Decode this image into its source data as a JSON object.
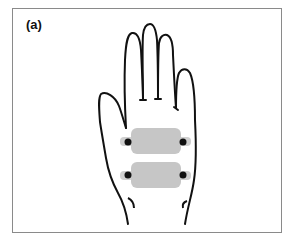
{
  "figure": {
    "panel_label": "(a)",
    "electrodes": [
      {
        "name": "upper-electrode-pad",
        "color": "#c4c4c4"
      },
      {
        "name": "lower-electrode-pad",
        "color": "#c4c4c4"
      }
    ],
    "colors": {
      "outline": "#111111",
      "pad": "#c6c6c6",
      "frame": "#8a8a8a",
      "contact": "#111111"
    }
  }
}
